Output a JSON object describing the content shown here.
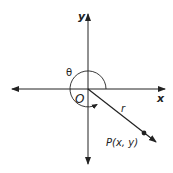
{
  "diagram": {
    "axes": {
      "x_label": "x",
      "y_label": "y"
    },
    "origin_label": "O",
    "angle_label": "θ",
    "radius_label": "r",
    "point_label": "P(x, y)",
    "colors": {
      "stroke": "#222222",
      "background": "#ffffff"
    }
  }
}
